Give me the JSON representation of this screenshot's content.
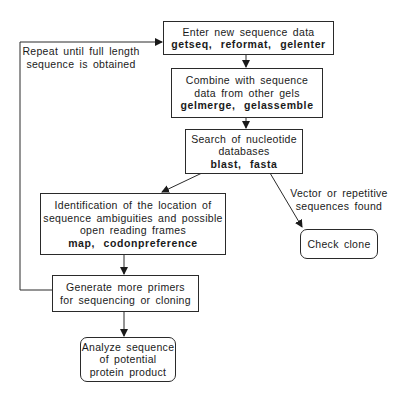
{
  "diagram": {
    "type": "flowchart",
    "nodes": [
      {
        "id": "enter",
        "lines": [
          "Enter new sequence data"
        ],
        "commands": "getseq,  reformat,  gelenter"
      },
      {
        "id": "combine",
        "lines": [
          "Combine with sequence",
          "data from other gels"
        ],
        "commands": "gelmerge,  gelassemble"
      },
      {
        "id": "search",
        "lines": [
          "Search of nucleotide",
          "databases"
        ],
        "commands": "blast,  fasta"
      },
      {
        "id": "identify",
        "lines": [
          "Identification of the location of",
          "sequence ambiguities and possible",
          "open reading frames"
        ],
        "commands": "map,  codonpreference"
      },
      {
        "id": "check",
        "lines": [
          "Check clone"
        ]
      },
      {
        "id": "generate",
        "lines": [
          "Generate more primers",
          "for sequencing or cloning"
        ]
      },
      {
        "id": "analyze",
        "lines": [
          "Analyze sequence",
          "of potential",
          "protein product"
        ]
      }
    ],
    "edge_labels": {
      "repeat": [
        "Repeat until full length",
        "sequence is obtained"
      ],
      "vector": [
        "Vector or repetitive",
        "sequences found"
      ]
    },
    "edges": [
      {
        "from": "enter",
        "to": "combine"
      },
      {
        "from": "combine",
        "to": "search"
      },
      {
        "from": "search",
        "to": "identify"
      },
      {
        "from": "search",
        "to": "check",
        "label": "vector"
      },
      {
        "from": "identify",
        "to": "generate"
      },
      {
        "from": "generate",
        "to": "analyze"
      },
      {
        "from": "generate",
        "to": "enter",
        "label": "repeat"
      }
    ]
  }
}
